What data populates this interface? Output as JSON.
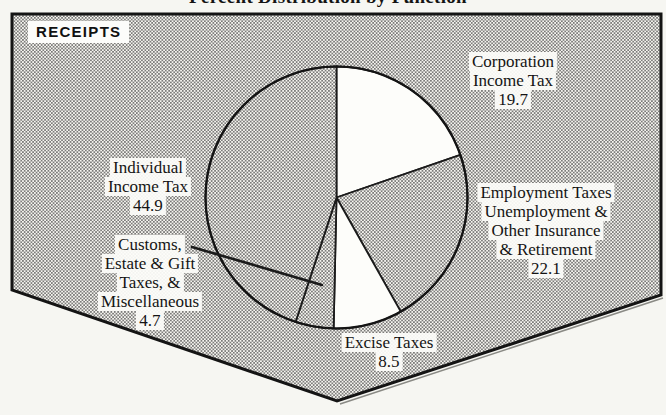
{
  "title": "Percent Distribution by Function",
  "panel": {
    "label": "RECEIPTS"
  },
  "chart_data": {
    "type": "pie",
    "title": "Percent Distribution by Function",
    "panel_label": "RECEIPTS",
    "unit": "percent",
    "start_angle_deg": 0,
    "direction": "clockwise",
    "segments": [
      {
        "id": "corporation",
        "label": "Corporation Income Tax",
        "label_lines": [
          "Corporation",
          "Income Tax"
        ],
        "value": 19.7,
        "fill": "white"
      },
      {
        "id": "employment",
        "label": "Employment Taxes Unemployment & Other Insurance & Retirement",
        "label_lines": [
          "Employment Taxes",
          "Unemployment &",
          "Other Insurance",
          "& Retirement"
        ],
        "value": 22.1,
        "fill": "stipple"
      },
      {
        "id": "excise",
        "label": "Excise Taxes",
        "label_lines": [
          "Excise Taxes"
        ],
        "value": 8.5,
        "fill": "white"
      },
      {
        "id": "customs",
        "label": "Customs, Estate & Gift Taxes, & Miscellaneous",
        "label_lines": [
          "Customs,",
          "Estate & Gift",
          "Taxes, &",
          "Miscellaneous"
        ],
        "value": 4.7,
        "fill": "stipple"
      },
      {
        "id": "individual",
        "label": "Individual Income Tax",
        "label_lines": [
          "Individual",
          "Income Tax"
        ],
        "value": 44.9,
        "fill": "stipple"
      }
    ]
  },
  "colors": {
    "ink": "#1b1b1b",
    "paper": "#f6f6f2",
    "stipple_bg": "#f7f6f1",
    "stipple_dot": "#3d3d3d",
    "slice_white": "#fdfdfa"
  }
}
